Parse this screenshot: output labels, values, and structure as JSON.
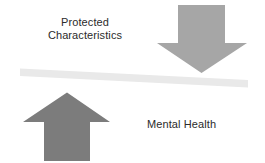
{
  "diagram": {
    "title_text": "",
    "background_color": "#FFFFFF",
    "labels": {
      "protected_line1": "Protected",
      "protected_line2": "Characteristics",
      "mental_health": "Mental Health"
    },
    "text_color": "#2B2B2B",
    "shapes": {
      "down_arrow": {
        "icon": "arrow-down-icon",
        "color": "#A6A6A6",
        "meaning": "downward pressure on protected characteristics side"
      },
      "up_arrow": {
        "icon": "arrow-up-icon",
        "color": "#7C7C7C",
        "meaning": "upward pressure on mental health side"
      },
      "beam": {
        "icon": "tilted-beam",
        "color": "#E9E9E9",
        "meaning": "seesaw beam tilted down to the right"
      }
    }
  }
}
